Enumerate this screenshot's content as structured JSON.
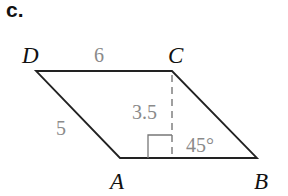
{
  "part_label": "c.",
  "figure": {
    "shape": "parallelogram",
    "vertices": [
      {
        "name": "D",
        "label": "D"
      },
      {
        "name": "C",
        "label": "C"
      },
      {
        "name": "B",
        "label": "B"
      },
      {
        "name": "A",
        "label": "A"
      }
    ],
    "measurements": {
      "top_side": "6",
      "left_side": "5",
      "height": "3.5",
      "angle": "45°"
    },
    "colors": {
      "edges": "#222222",
      "measure_text": "#8a8a8a",
      "vertex_text": "#111111"
    }
  }
}
